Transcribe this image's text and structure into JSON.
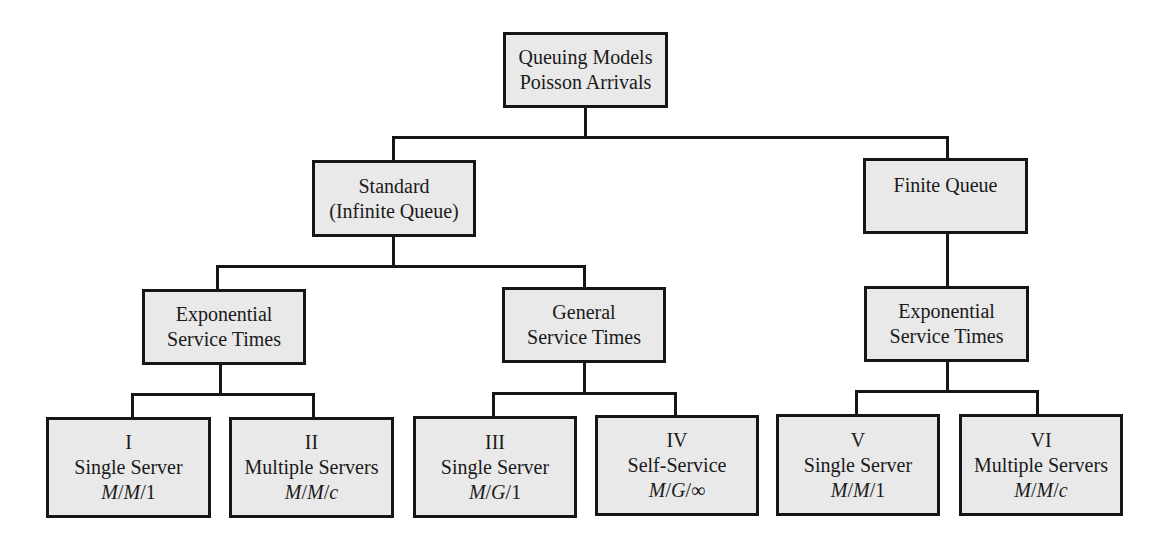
{
  "diagram": {
    "type": "tree",
    "root": {
      "id": "root",
      "lines": [
        "Queuing Models",
        "Poisson Arrivals"
      ]
    },
    "level1": [
      {
        "id": "standard",
        "lines": [
          "Standard",
          "(Infinite Queue)"
        ]
      },
      {
        "id": "finite",
        "lines": [
          "Finite Queue"
        ]
      }
    ],
    "level2": [
      {
        "id": "std-exponential",
        "parent": "standard",
        "lines": [
          "Exponential",
          "Service Times"
        ]
      },
      {
        "id": "std-general",
        "parent": "standard",
        "lines": [
          "General",
          "Service Times"
        ]
      },
      {
        "id": "fin-exponential",
        "parent": "finite",
        "lines": [
          "Exponential",
          "Service Times"
        ]
      }
    ],
    "leaves": [
      {
        "id": "I",
        "parent": "std-exponential",
        "numeral": "I",
        "label": "Single Server",
        "notation": {
          "a": "M",
          "b": "M",
          "c": "1"
        }
      },
      {
        "id": "II",
        "parent": "std-exponential",
        "numeral": "II",
        "label": "Multiple Servers",
        "notation": {
          "a": "M",
          "b": "M",
          "c": "c"
        }
      },
      {
        "id": "III",
        "parent": "std-general",
        "numeral": "III",
        "label": "Single Server",
        "notation": {
          "a": "M",
          "b": "G",
          "c": "1"
        }
      },
      {
        "id": "IV",
        "parent": "std-general",
        "numeral": "IV",
        "label": "Self-Service",
        "notation": {
          "a": "M",
          "b": "G",
          "c": "∞"
        }
      },
      {
        "id": "V",
        "parent": "fin-exponential",
        "numeral": "V",
        "label": "Single Server",
        "notation": {
          "a": "M",
          "b": "M",
          "c": "1"
        }
      },
      {
        "id": "VI",
        "parent": "fin-exponential",
        "numeral": "VI",
        "label": "Multiple Servers",
        "notation": {
          "a": "M",
          "b": "M",
          "c": "c"
        }
      }
    ],
    "separator": "/",
    "colors": {
      "box_fill": "#e9e9e9",
      "stroke": "#161616",
      "background": "#ffffff"
    }
  }
}
